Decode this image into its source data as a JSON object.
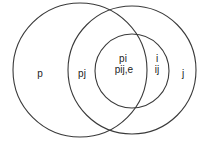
{
  "diagram": {
    "type": "venn",
    "sets": [
      {
        "id": "left",
        "name": "left-circle"
      },
      {
        "id": "right",
        "name": "right-circle"
      },
      {
        "id": "inner",
        "name": "inner-circle"
      }
    ],
    "regions": {
      "left_only": "p",
      "left_right_overlap": "pj",
      "inner_left_top": "pi",
      "inner_left_bottom": "pij,e",
      "inner_right_top": "i",
      "inner_right_bottom": "ij",
      "right_only": "j"
    },
    "colors": {
      "stroke": "#3a3a3a",
      "text": "#222222",
      "background": "#ffffff"
    }
  }
}
